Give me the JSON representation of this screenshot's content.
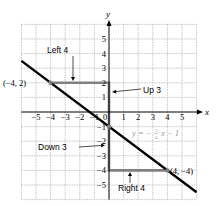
{
  "diagram": {
    "type": "coordinate-plane-slope",
    "axes": {
      "x_label": "x",
      "y_label": "y",
      "x_ticks": [
        "−5",
        "−4",
        "−3",
        "−2",
        "−1",
        "0",
        "1",
        "2",
        "3",
        "4",
        "5"
      ],
      "y_ticks": [
        "5",
        "4",
        "3",
        "2",
        "1",
        "−1",
        "−2",
        "−3",
        "−4",
        "−5"
      ],
      "x_range": [
        -6,
        6
      ],
      "y_range": [
        -6,
        6
      ],
      "grid": true
    },
    "line": {
      "equation": "y = −3/4 x − 1",
      "equation_prefix": "y = −",
      "equation_num": "3",
      "equation_den": "4",
      "equation_suffix": "x − 1",
      "slope": -0.75,
      "intercept": -1,
      "color": "#000000"
    },
    "points": [
      {
        "label": "(−4, 2)",
        "x": -4,
        "y": 2
      },
      {
        "label": "(4, −4)",
        "x": 4,
        "y": -4
      },
      {
        "label": "",
        "x": 0,
        "y": -1
      }
    ],
    "annotations": {
      "left": "Left 4",
      "up": "Up 3",
      "down": "Down 3",
      "right": "Right 4"
    },
    "colors": {
      "grid": "#b8b8b8",
      "step_path": "#808080",
      "equation": "#9a9a9a",
      "axis": "#000000"
    }
  }
}
